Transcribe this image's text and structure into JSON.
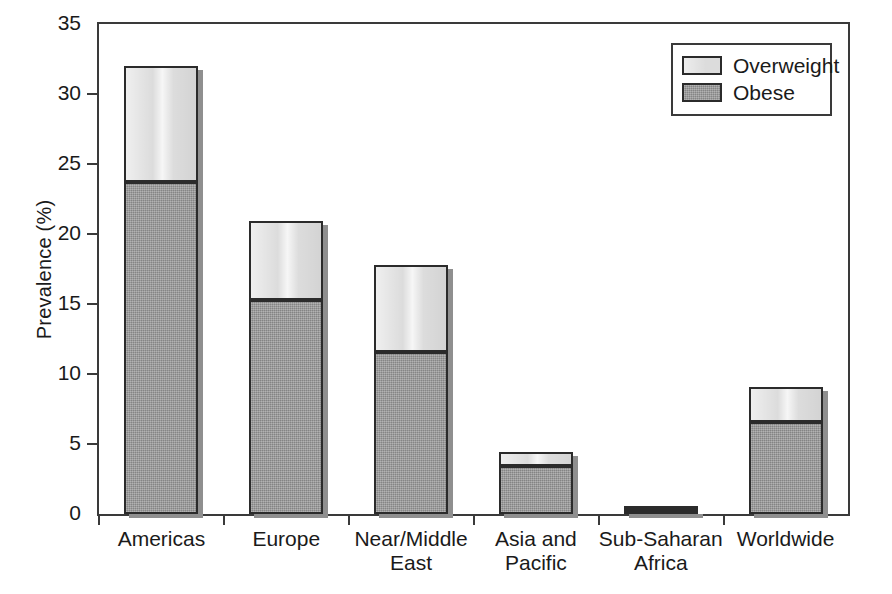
{
  "chart_data": {
    "type": "bar",
    "subtype": "stacked-bar",
    "title": "",
    "xlabel": "",
    "ylabel": "Prevalence (%)",
    "ylim": [
      0,
      35
    ],
    "yticks": [
      0,
      5,
      10,
      15,
      20,
      25,
      30,
      35
    ],
    "ytick_labels": [
      "0",
      "5",
      "10",
      "15",
      "20",
      "25",
      "30",
      "35"
    ],
    "grid": false,
    "legend_position": "top-right",
    "categories": [
      "Americas",
      "Europe",
      "Near/Middle\nEast",
      "Asia and\nPacific",
      "Sub-Saharan\nAfrica",
      "Worldwide"
    ],
    "series": [
      {
        "name": "Obese",
        "color": "#949494",
        "values": [
          23.7,
          15.3,
          11.6,
          3.4,
          0.2,
          6.6
        ]
      },
      {
        "name": "Overweight",
        "color": "#dcdcdc",
        "values": [
          8.3,
          5.6,
          6.2,
          1.0,
          0.1,
          2.5
        ]
      }
    ],
    "totals": [
      32.0,
      20.9,
      17.8,
      4.4,
      0.3,
      9.1
    ],
    "stack_order": [
      "Obese",
      "Overweight"
    ],
    "annotations": []
  },
  "legend": {
    "entries": [
      {
        "label": "Overweight",
        "swatch": "light-gray-swatch"
      },
      {
        "label": "Obese",
        "swatch": "dark-gray-swatch"
      }
    ]
  },
  "colors": {
    "overweight_fill": "#dcdcdc",
    "obese_fill": "#949494",
    "bar_outline": "#2b2b2b",
    "axis": "#3a3a3a",
    "background": "#ffffff",
    "text": "#1a1a1a"
  }
}
